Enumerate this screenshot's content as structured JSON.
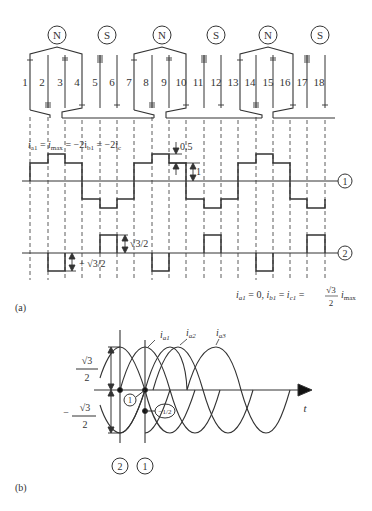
{
  "figure_a": {
    "caption": "(a)",
    "poles": [
      {
        "label": "N",
        "x": 57
      },
      {
        "label": "S",
        "x": 107
      },
      {
        "label": "N",
        "x": 162
      },
      {
        "label": "S",
        "x": 216
      },
      {
        "label": "N",
        "x": 268
      },
      {
        "label": "S",
        "x": 320
      }
    ],
    "slots": [
      "1",
      "2",
      "3",
      "4",
      "5",
      "6",
      "7",
      "8",
      "9",
      "10",
      "11",
      "12",
      "13",
      "14",
      "15",
      "16",
      "17",
      "18"
    ],
    "waveform1": {
      "marker": "1",
      "annotation_prefix": "i",
      "annotation": "i_a1 = i_max = −2i_b1 = −2i_c",
      "annotation_parts": {
        "a": "a1",
        "eq1": " = ",
        "imax": "i",
        "max": "max",
        "rest": " = −2i",
        "b1": "b1",
        "rest2": " = −2i",
        "c": "c"
      },
      "step_label_top": "0.5",
      "step_label_bottom": "1",
      "levels": [
        1,
        1.5,
        1,
        -1,
        -1.5,
        -1,
        1,
        1.5,
        1,
        -1,
        -1.5,
        -1,
        1,
        1.5,
        1,
        -1,
        -1.5,
        -1
      ]
    },
    "waveform2": {
      "marker": "2",
      "label_pos": "√3/2",
      "label_neg": "+ √3/2",
      "levels": [
        0,
        0,
        -1,
        0,
        0,
        1,
        0,
        0,
        -1,
        0,
        0,
        1,
        0,
        0,
        -1,
        0,
        0,
        1
      ]
    },
    "condition": {
      "text": "i_a1 = 0, i_b1 = i_c1 = √3/2 i_max",
      "left": "i",
      "a1": "a1",
      "mid1": " = 0, ",
      "b": "i",
      "b1": "b1",
      "mid2": " = ",
      "c": "i",
      "c1": "c1",
      "mid3": " = ",
      "num": "√3",
      "den": "2",
      "imax": "i",
      "max": "max"
    }
  },
  "figure_b": {
    "caption": "(b)",
    "y_labels": {
      "top_num": "√3",
      "top_den": "2",
      "bot_sign": "−",
      "bot_num": "√3",
      "bot_den": "2"
    },
    "curves": [
      {
        "name": "i_a1",
        "base": "i",
        "sub": "a1"
      },
      {
        "name": "i_a2",
        "base": "i",
        "sub": "a2"
      },
      {
        "name": "i_a3",
        "base": "i",
        "sub": "a3"
      }
    ],
    "axis_label": "t",
    "point_markers": {
      "m1": "1",
      "minus_half": "−1/2"
    },
    "instant_markers": [
      "2",
      "1"
    ]
  }
}
